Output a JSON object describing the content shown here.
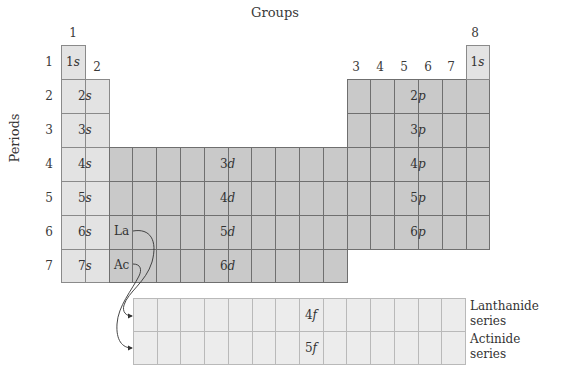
{
  "title": "Groups",
  "axis_label": "Periods",
  "groups": [
    {
      "label": "1",
      "x": 73
    },
    {
      "label": "2",
      "x": 97
    },
    {
      "label": "3",
      "x": 356
    },
    {
      "label": "4",
      "x": 380
    },
    {
      "label": "5",
      "x": 404
    },
    {
      "label": "6",
      "x": 428
    },
    {
      "label": "7",
      "x": 451
    },
    {
      "label": "8",
      "x": 475
    }
  ],
  "periods": [
    "1",
    "2",
    "3",
    "4",
    "5",
    "6",
    "7"
  ],
  "s_block": {
    "labels": [
      "1s",
      "2s",
      "3s",
      "4s",
      "5s",
      "6s",
      "7s"
    ],
    "helium_label": "1s"
  },
  "d_block": {
    "labels": [
      "3d",
      "4d",
      "5d",
      "6d"
    ],
    "la": "La",
    "ac": "Ac"
  },
  "p_block": {
    "labels": [
      "2p",
      "3p",
      "4p",
      "5p",
      "6p"
    ]
  },
  "f_block": {
    "labels": [
      "4f",
      "5f"
    ],
    "series": [
      {
        "line1": "Lanthanide",
        "line2": "series"
      },
      {
        "line1": "Actinide",
        "line2": "series"
      }
    ]
  },
  "colors": {
    "s_block": "#e3e3e3",
    "d_p_block": "#c9c9c9",
    "f_block": "#ececec",
    "grid_line": "#6f6f6f"
  }
}
